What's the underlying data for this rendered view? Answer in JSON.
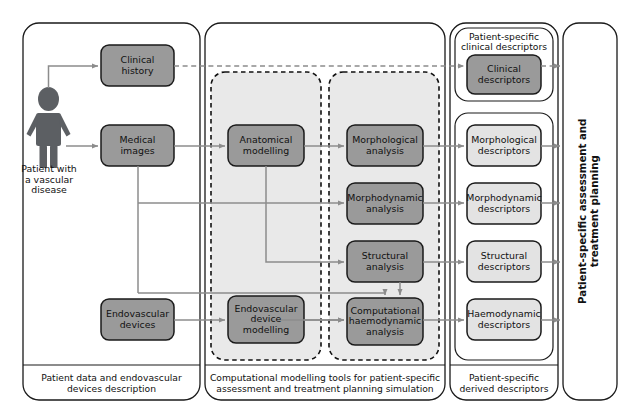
{
  "diagram": {
    "colors": {
      "dark_box_fill": "#9a9a9a",
      "light_box_fill": "#e3e3e3",
      "panel_fill": "#e8e8e8",
      "stroke": "#1a1a1a",
      "arrow": "#8c8c8c",
      "background": "#ffffff"
    }
  },
  "columns": {
    "patient_data": {
      "footer": "Patient data and endovascular devices description",
      "footer_line1": "Patient data and endovascular",
      "footer_line2": "devices description",
      "patient_caption_line1": "Patient with",
      "patient_caption_line2": "a vascular",
      "patient_caption_line3": "disease",
      "boxes": [
        {
          "id": "clinical-history",
          "line1": "Clinical",
          "line2": "history",
          "shade": "dark"
        },
        {
          "id": "medical-images",
          "line1": "Medical",
          "line2": "images",
          "shade": "dark"
        },
        {
          "id": "endovascular-devices",
          "line1": "Endovascular",
          "line2": "devices",
          "shade": "dark"
        }
      ]
    },
    "modelling_tools": {
      "footer": "Computational modelling tools for patient-specific assessment and treatment planning simulation",
      "footer_line1": "Computational modelling tools for patient-specific",
      "footer_line2": "assessment and treatment planning simulation",
      "group_modelling": [
        {
          "id": "anatomical-modelling",
          "line1": "Anatomical",
          "line2": "modelling",
          "line3": "",
          "shade": "dark"
        },
        {
          "id": "endovascular-device-modelling",
          "line1": "Endovascular",
          "line2": "device",
          "line3": "modelling",
          "shade": "dark"
        }
      ],
      "group_analysis": [
        {
          "id": "morphological-analysis",
          "line1": "Morphological",
          "line2": "analysis",
          "line3": "",
          "shade": "dark"
        },
        {
          "id": "morphodynamic-analysis",
          "line1": "Morphodynamic",
          "line2": "analysis",
          "line3": "",
          "shade": "dark"
        },
        {
          "id": "structural-analysis",
          "line1": "Structural",
          "line2": "analysis",
          "line3": "",
          "shade": "dark"
        },
        {
          "id": "computational-haemodynamic-analysis",
          "line1": "Computational",
          "line2": "haemodynamic",
          "line3": "analysis",
          "shade": "dark"
        }
      ]
    },
    "descriptors": {
      "footer": "Patient-specific derived descriptors",
      "footer_line1": "Patient-specific",
      "footer_line2": "derived descriptors",
      "clinical_group_caption_line1": "Patient-specific",
      "clinical_group_caption_line2": "clinical descriptors",
      "boxes": [
        {
          "id": "clinical-descriptors",
          "line1": "Clinical",
          "line2": "descriptors",
          "shade": "dark"
        },
        {
          "id": "morphological-descriptors",
          "line1": "Morphological",
          "line2": "descriptors",
          "shade": "light"
        },
        {
          "id": "morphodynamic-descriptors",
          "line1": "Morphodynamic",
          "line2": "descriptors",
          "shade": "light"
        },
        {
          "id": "structural-descriptors",
          "line1": "Structural",
          "line2": "descriptors",
          "shade": "light"
        },
        {
          "id": "haemodynamic-descriptors",
          "line1": "Haemodynamic",
          "line2": "descriptors",
          "shade": "light"
        }
      ]
    },
    "outcome": {
      "vertical_label_line1": "Patient-specific assessment and",
      "vertical_label_line2": "treatment planning"
    }
  }
}
